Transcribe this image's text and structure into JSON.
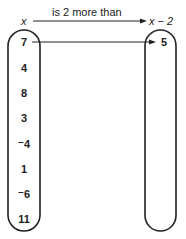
{
  "diagram": {
    "relation_label": "is 2 more than",
    "domain_label": "x",
    "codomain_label": "x − 2",
    "domain_values": [
      "7",
      "4",
      "8",
      "3",
      "⁻4",
      "1",
      "⁻6",
      "11"
    ],
    "mapped_values": [
      "5"
    ],
    "mapping": [
      {
        "from": "7",
        "to": "5"
      }
    ]
  }
}
